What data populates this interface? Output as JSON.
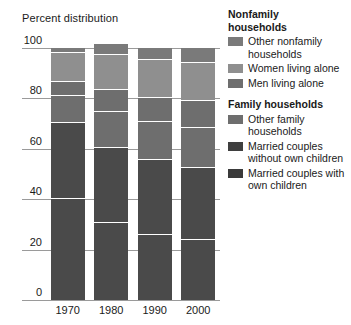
{
  "chart_data": {
    "type": "bar",
    "stacked": true,
    "title": "",
    "ylabel": "Percent distribution",
    "xlabel": "",
    "ylim": [
      0,
      100
    ],
    "yticks": [
      0,
      20,
      40,
      60,
      80,
      100
    ],
    "grid": true,
    "legend_position": "right",
    "categories": [
      "1970",
      "1980",
      "1990",
      "2000"
    ],
    "series": [
      {
        "name": "Married couples with own children",
        "group": "Family households",
        "color": "#4a4a4a",
        "values": [
          40.3,
          30.9,
          26.3,
          24.1
        ]
      },
      {
        "name": "Married couples without own children",
        "group": "Family households",
        "color": "#4a4a4a",
        "values": [
          30.3,
          29.9,
          29.8,
          28.7
        ]
      },
      {
        "name": "Other family households",
        "group": "Family households",
        "color": "#6e6e6e",
        "values": [
          10.6,
          14.4,
          14.8,
          16.0
        ]
      },
      {
        "name": "Men living alone",
        "group": "Nonfamily households",
        "color": "#6e6e6e",
        "values": [
          5.6,
          8.6,
          9.7,
          10.7
        ]
      },
      {
        "name": "Women living alone",
        "group": "Nonfamily households",
        "color": "#8f8f8f",
        "values": [
          11.5,
          14.0,
          14.9,
          14.8
        ]
      },
      {
        "name": "Other nonfamily households",
        "group": "Nonfamily households",
        "color": "#7a7a7a",
        "values": [
          1.7,
          3.6,
          4.6,
          5.7
        ]
      }
    ]
  },
  "axis": {
    "title": "Percent distribution",
    "ytick_labels": [
      "100",
      "80",
      "60",
      "40",
      "20",
      "0"
    ],
    "xtick_labels": [
      "1970",
      "1980",
      "1990",
      "2000"
    ]
  },
  "legend": {
    "groups": [
      {
        "title": "Nonfamily households",
        "title_line1": "Nonfamily",
        "title_line2": "households",
        "items": [
          {
            "label": "Other nonfamily households",
            "color": "#7a7a7a"
          },
          {
            "label": "Women living alone",
            "color": "#8f8f8f"
          },
          {
            "label": "Men living alone",
            "color": "#6e6e6e"
          }
        ]
      },
      {
        "title": "Family households",
        "items": [
          {
            "label": "Other family households",
            "color": "#6e6e6e"
          },
          {
            "label": "Married couples without own children",
            "color": "#3f3f3f"
          },
          {
            "label": "Married couples with own children",
            "color": "#3a3a3a"
          }
        ]
      }
    ]
  },
  "colors": {
    "background": "#ffffff",
    "gridline": "#9a9a9a",
    "text": "#1a1a1a",
    "separator": "#ffffff"
  }
}
